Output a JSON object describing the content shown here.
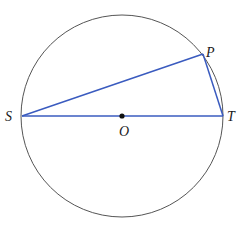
{
  "diagram": {
    "type": "circle-geometry",
    "colors": {
      "circle": "#555555",
      "segments": "#3a5bbf",
      "center_dot": "#111111",
      "labels": "#1a1a1a"
    },
    "circle": {
      "center": "O",
      "cx": 122,
      "cy": 116,
      "r": 101
    },
    "points": {
      "S": {
        "label": "S",
        "x": 22,
        "y": 116
      },
      "T": {
        "label": "T",
        "x": 223,
        "y": 116
      },
      "P": {
        "label": "P",
        "x": 203,
        "y": 54
      },
      "O": {
        "label": "O",
        "x": 122,
        "y": 116
      }
    },
    "segments": [
      {
        "from": "S",
        "to": "T",
        "note": "diameter"
      },
      {
        "from": "S",
        "to": "P"
      },
      {
        "from": "P",
        "to": "T"
      }
    ]
  }
}
